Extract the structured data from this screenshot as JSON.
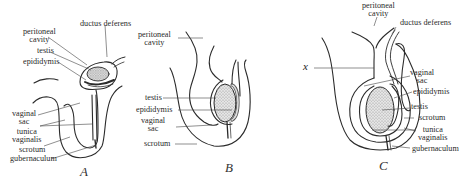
{
  "figure": {
    "panels": [
      {
        "id": "A",
        "letter": "A",
        "labels": {
          "peritoneal_cavity_1": "peritoneal",
          "peritoneal_cavity_2": "cavity",
          "ductus_deferens": "ductus deferens",
          "testis": "testis",
          "epididymis": "epididymis",
          "vaginal_sac_1": "vaginal",
          "vaginal_sac_2": "sac",
          "tunica_vaginalis_1": "tunica",
          "tunica_vaginalis_2": "vaginalis",
          "scrotum": "scrotum",
          "gubernaculum": "gubernaculum"
        }
      },
      {
        "id": "B",
        "letter": "B",
        "labels": {
          "peritoneal_cavity_1": "peritoneal",
          "peritoneal_cavity_2": "cavity",
          "testis": "testis",
          "epididymis": "epididymis",
          "vaginal_sac_1": "vaginal",
          "vaginal_sac_2": "sac",
          "scrotum": "scrotum"
        }
      },
      {
        "id": "C",
        "letter": "C",
        "x_marker": "x",
        "labels": {
          "peritoneal_cavity_1": "peritoneal",
          "peritoneal_cavity_2": "cavity",
          "ductus_deferens": "ductus deferens",
          "vaginal_sac_1": "vaginal",
          "vaginal_sac_2": "sac",
          "epididymis": "epididymis",
          "testis": "testis",
          "scrotum": "scrotum",
          "tunica_vaginalis_1": "tunica",
          "tunica_vaginalis_2": "vaginalis",
          "gubernaculum": "gubernaculum"
        }
      }
    ]
  },
  "colors": {
    "line": "#2b2b2b",
    "leader": "#444444",
    "stipple": "#9a9a9a",
    "background": "#ffffff"
  }
}
